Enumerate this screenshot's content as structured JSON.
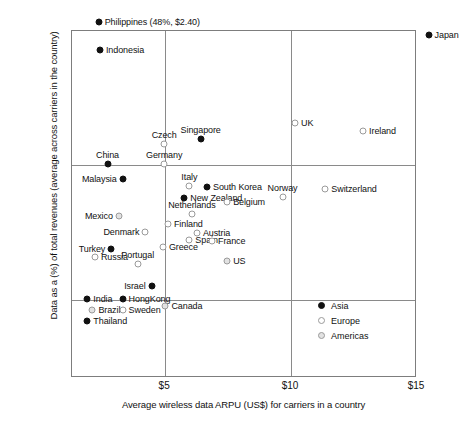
{
  "chart_data": {
    "type": "scatter",
    "title": "",
    "xlabel": "Average wireless data ARPU (US$) for carriers in a country",
    "ylabel": "Data as a (%) of total revenues (average across carriers in the country)",
    "xlim": [
      1.3,
      15.0
    ],
    "ylim": [
      4.2,
      30.0
    ],
    "xticks": [
      "$5",
      "$10",
      "$15"
    ],
    "xtick_values": [
      5,
      10,
      15
    ],
    "yticks": [
      "10%",
      "20%",
      "30%"
    ],
    "ytick_values": [
      10,
      20,
      30
    ],
    "grid": true,
    "grid_lines": {
      "vertical_at": [
        5,
        10
      ],
      "horizontal_at": [
        10,
        20
      ]
    },
    "legend": {
      "position": "inside-lower-right",
      "entries": [
        {
          "label": "Asia",
          "marker": "filled-circle",
          "color": "#111111"
        },
        {
          "label": "Europe",
          "marker": "open-circle",
          "color": "#9a9a9a"
        },
        {
          "label": "Americas",
          "marker": "shaded-circle",
          "color": "#e2e2e2"
        }
      ]
    },
    "annotations": [
      {
        "text": "Philippines (48%, $2.40)",
        "note": "outlier point plotted above axis maximum"
      }
    ],
    "points": [
      {
        "label": "Philippines (48%, $2.40)",
        "series": "Asia",
        "x": 2.4,
        "y": 30.6,
        "label_pos": "right"
      },
      {
        "label": "Japan",
        "series": "Asia",
        "x": 15.5,
        "y": 29.6,
        "label_pos": "right"
      },
      {
        "label": "Indonesia",
        "series": "Asia",
        "x": 2.45,
        "y": 28.5,
        "label_pos": "right"
      },
      {
        "label": "UK",
        "series": "Europe",
        "x": 10.2,
        "y": 23.1,
        "label_pos": "right"
      },
      {
        "label": "Ireland",
        "series": "Europe",
        "x": 12.9,
        "y": 22.5,
        "label_pos": "right"
      },
      {
        "label": "Singapore",
        "series": "Asia",
        "x": 6.45,
        "y": 21.9,
        "label_pos": "top"
      },
      {
        "label": "Czech",
        "series": "Europe",
        "x": 5.0,
        "y": 21.5,
        "label_pos": "top"
      },
      {
        "label": "Germany",
        "series": "Europe",
        "x": 5.0,
        "y": 20.0,
        "label_pos": "top"
      },
      {
        "label": "China",
        "series": "Asia",
        "x": 2.75,
        "y": 20.0,
        "label_pos": "top"
      },
      {
        "label": "Malaysia",
        "series": "Asia",
        "x": 3.35,
        "y": 18.9,
        "label_pos": "left"
      },
      {
        "label": "Italy",
        "series": "Europe",
        "x": 6.0,
        "y": 18.4,
        "label_pos": "top"
      },
      {
        "label": "South Korea",
        "series": "Asia",
        "x": 6.7,
        "y": 18.3,
        "label_pos": "right"
      },
      {
        "label": "Switzerland",
        "series": "Europe",
        "x": 11.4,
        "y": 18.2,
        "label_pos": "right"
      },
      {
        "label": "Norway",
        "series": "Europe",
        "x": 9.7,
        "y": 17.6,
        "label_pos": "top"
      },
      {
        "label": "New Zealand",
        "series": "Asia",
        "x": 5.8,
        "y": 17.5,
        "label_pos": "right"
      },
      {
        "label": "Belgium",
        "series": "Europe",
        "x": 7.5,
        "y": 17.2,
        "label_pos": "right"
      },
      {
        "label": "Mexico",
        "series": "Americas",
        "x": 3.2,
        "y": 16.2,
        "label_pos": "left"
      },
      {
        "label": "Netherlands",
        "series": "Europe",
        "x": 6.1,
        "y": 16.3,
        "label_pos": "top"
      },
      {
        "label": "Finland",
        "series": "Europe",
        "x": 5.15,
        "y": 15.6,
        "label_pos": "right"
      },
      {
        "label": "Austria",
        "series": "Europe",
        "x": 6.3,
        "y": 14.9,
        "label_pos": "right"
      },
      {
        "label": "Denmark",
        "series": "Europe",
        "x": 4.25,
        "y": 15.0,
        "label_pos": "left"
      },
      {
        "label": "Spain",
        "series": "Europe",
        "x": 6.0,
        "y": 14.4,
        "label_pos": "right"
      },
      {
        "label": "France",
        "series": "Europe",
        "x": 6.9,
        "y": 14.3,
        "label_pos": "right"
      },
      {
        "label": "Greece",
        "series": "Europe",
        "x": 4.95,
        "y": 13.9,
        "label_pos": "right"
      },
      {
        "label": "Turkey",
        "series": "Asia",
        "x": 2.9,
        "y": 13.7,
        "label_pos": "left"
      },
      {
        "label": "Russia",
        "series": "Europe",
        "x": 2.25,
        "y": 13.1,
        "label_pos": "right"
      },
      {
        "label": "Portugal",
        "series": "Europe",
        "x": 3.95,
        "y": 12.6,
        "label_pos": "top"
      },
      {
        "label": "US",
        "series": "Americas",
        "x": 7.5,
        "y": 12.8,
        "label_pos": "right"
      },
      {
        "label": "Israel",
        "series": "Asia",
        "x": 4.5,
        "y": 11.0,
        "label_pos": "left"
      },
      {
        "label": "India",
        "series": "Asia",
        "x": 1.95,
        "y": 10.0,
        "label_pos": "right"
      },
      {
        "label": "HongKong",
        "series": "Asia",
        "x": 3.35,
        "y": 10.0,
        "label_pos": "right"
      },
      {
        "label": "Canada",
        "series": "Americas",
        "x": 5.05,
        "y": 9.5,
        "label_pos": "right"
      },
      {
        "label": "Brazil",
        "series": "Americas",
        "x": 2.15,
        "y": 9.2,
        "label_pos": "right"
      },
      {
        "label": "Sweden",
        "series": "Europe",
        "x": 3.35,
        "y": 9.2,
        "label_pos": "right"
      },
      {
        "label": "Thailand",
        "series": "Asia",
        "x": 1.95,
        "y": 8.4,
        "label_pos": "right"
      }
    ]
  }
}
